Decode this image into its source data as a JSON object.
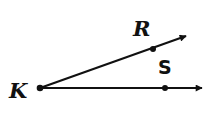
{
  "diagram": {
    "type": "angle",
    "vertex": {
      "label": "K",
      "x": 40,
      "y": 88
    },
    "rays": [
      {
        "name": "ray-KR",
        "point_label": "R",
        "point": {
          "x": 153,
          "y": 49
        },
        "end": {
          "x": 188,
          "y": 35
        }
      },
      {
        "name": "ray-KS",
        "point_label": "S",
        "point": {
          "x": 165,
          "y": 88
        },
        "end": {
          "x": 204,
          "y": 88
        }
      }
    ],
    "labels": {
      "vertex": "K",
      "upper": "R",
      "lower": "S"
    },
    "colors": {
      "stroke": "#111111",
      "background": "#ffffff"
    }
  }
}
